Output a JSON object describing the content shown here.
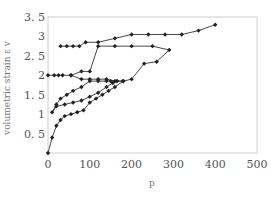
{
  "chart_data": {
    "type": "line",
    "title": "",
    "xlabel": "p",
    "ylabel": "volumetric strain ε v",
    "xlim": [
      0,
      500
    ],
    "ylim": [
      0,
      3.5
    ],
    "xticks": [
      "0",
      "100",
      "200",
      "300",
      "400",
      "500"
    ],
    "yticks": [
      "0.5",
      "1",
      "1.5",
      "2",
      "2.5",
      "3",
      "3.5"
    ],
    "grid": false,
    "legend": null,
    "marker": "diamond",
    "line_color": "#333333",
    "series": [
      {
        "name": "loading-1",
        "x": [
          0,
          10,
          20,
          30,
          40,
          55,
          70,
          85,
          100,
          115,
          130,
          145,
          160,
          180
        ],
        "y": [
          0.0,
          0.4,
          0.7,
          0.85,
          0.95,
          1.0,
          1.05,
          1.1,
          1.3,
          1.4,
          1.5,
          1.6,
          1.7,
          1.85
        ]
      },
      {
        "name": "unload-reload-1",
        "x": [
          180,
          165,
          150,
          140,
          120,
          100,
          80,
          60,
          45,
          30,
          20,
          10,
          20,
          40,
          60,
          80,
          100,
          120,
          140,
          155,
          165
        ],
        "y": [
          1.85,
          1.85,
          1.85,
          1.85,
          1.85,
          1.85,
          1.7,
          1.6,
          1.5,
          1.4,
          1.25,
          1.05,
          1.2,
          1.25,
          1.3,
          1.35,
          1.45,
          1.55,
          1.7,
          1.8,
          1.85
        ]
      },
      {
        "name": "cycle-2",
        "x": [
          0,
          15,
          25,
          35,
          55,
          80,
          100,
          120,
          140,
          160,
          180,
          200,
          230,
          260,
          290,
          250,
          200,
          160,
          120,
          100,
          80,
          55
        ],
        "y": [
          2.0,
          2.0,
          2.0,
          2.0,
          2.0,
          1.9,
          1.9,
          1.9,
          1.9,
          1.85,
          1.85,
          1.9,
          2.3,
          2.35,
          2.65,
          2.75,
          2.75,
          2.75,
          2.75,
          2.1,
          2.1,
          2.0
        ]
      },
      {
        "name": "cycle-3",
        "x": [
          30,
          45,
          60,
          75,
          90,
          120,
          160,
          200,
          240,
          280,
          320,
          360,
          400
        ],
        "y": [
          2.75,
          2.75,
          2.75,
          2.75,
          2.85,
          2.85,
          2.95,
          3.05,
          3.05,
          3.05,
          3.05,
          3.15,
          3.3
        ]
      }
    ]
  }
}
